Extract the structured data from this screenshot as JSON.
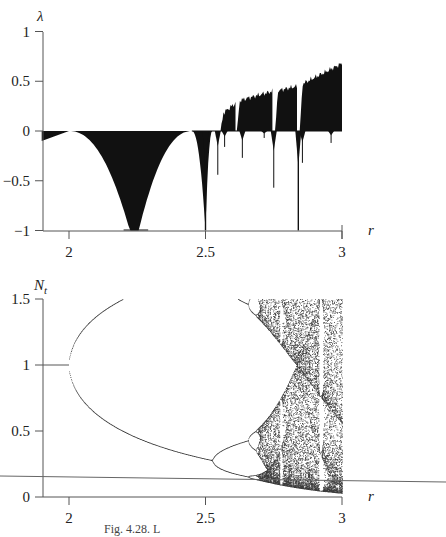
{
  "figure": {
    "caption": "Fig. 4.28. L",
    "colors": {
      "ink": "#111111",
      "axis": "#555555",
      "background": "#ffffff",
      "stray_line": "#666666"
    }
  },
  "chart_data": [
    {
      "type": "area",
      "title": "",
      "xlabel": "r",
      "ylabel": "λ",
      "xlim": [
        1.9,
        3.0
      ],
      "ylim": [
        -1,
        1
      ],
      "xticks": [
        2,
        2.5,
        3
      ],
      "xtick_labels": [
        "2",
        "2.5",
        "3"
      ],
      "yticks": [
        1,
        0.5,
        0,
        -0.5,
        -1
      ],
      "ytick_labels": [
        "1",
        "0.5",
        "0",
        "−0.5",
        "−1"
      ],
      "grid": false,
      "legend": null,
      "description": "Lyapunov exponent λ vs r, filled black between curve and λ=0",
      "series": [
        {
          "name": "Lyapunov exponent",
          "x": [
            1.9,
            2.0,
            2.05,
            2.1,
            2.15,
            2.2,
            2.25,
            2.3,
            2.35,
            2.4,
            2.45,
            2.47,
            2.49,
            2.5,
            2.51,
            2.53,
            2.55,
            2.56,
            2.57,
            2.6,
            2.63,
            2.65,
            2.7,
            2.74,
            2.75,
            2.76,
            2.8,
            2.83,
            2.84,
            2.85,
            2.9,
            2.95,
            3.0
          ],
          "y": [
            -0.1,
            0.0,
            -0.12,
            -0.28,
            -0.5,
            -0.8,
            -1.0,
            -0.8,
            -0.5,
            -0.25,
            -0.05,
            -0.3,
            -0.55,
            -1.0,
            -0.3,
            -0.1,
            -0.05,
            0.1,
            0.2,
            0.27,
            0.3,
            -0.25,
            0.34,
            0.38,
            -0.58,
            0.42,
            0.43,
            0.4,
            -1.0,
            0.45,
            0.55,
            0.62,
            0.68
          ]
        }
      ],
      "spikes_negative": [
        {
          "r": 2.5,
          "depth": -1.0
        },
        {
          "r": 2.545,
          "depth": -0.44
        },
        {
          "r": 2.57,
          "depth": -0.16
        },
        {
          "r": 2.635,
          "depth": -0.27
        },
        {
          "r": 2.715,
          "depth": -0.07
        },
        {
          "r": 2.75,
          "depth": -0.57
        },
        {
          "r": 2.84,
          "depth": -1.0
        },
        {
          "r": 2.855,
          "depth": -0.32
        },
        {
          "r": 2.96,
          "depth": -0.12
        }
      ]
    },
    {
      "type": "scatter",
      "title": "",
      "xlabel": "r",
      "ylabel": "N_t",
      "xlim": [
        1.9,
        3.0
      ],
      "ylim": [
        0,
        1.5
      ],
      "xticks": [
        2,
        2.5,
        3
      ],
      "xtick_labels": [
        "2",
        "2.5",
        "3"
      ],
      "yticks": [
        1.5,
        1,
        0.5,
        0
      ],
      "ytick_labels": [
        "1.5",
        "1",
        "0.5",
        "0"
      ],
      "grid": false,
      "legend": null,
      "description": "Bifurcation diagram of N_t vs r: fixed point 1 until r=2, period-doubling cascade near 2.45–2.57, chaos up to r=3 with periodic windows",
      "fixed_point": {
        "r_range": [
          1.9,
          2.0
        ],
        "N": 1.0
      },
      "period2_branches": {
        "r": [
          2.0,
          2.1,
          2.2,
          2.3,
          2.4,
          2.45
        ],
        "upper": [
          1.0,
          1.12,
          1.16,
          1.18,
          1.19,
          1.2
        ],
        "lower": [
          1.0,
          0.84,
          0.76,
          0.7,
          0.66,
          0.64
        ]
      },
      "period4_onset_r": 2.45,
      "chaos_onset_r": 2.57,
      "chaos_envelope": {
        "r": [
          2.57,
          2.7,
          2.8,
          2.9,
          3.0
        ],
        "max": [
          1.22,
          1.25,
          1.28,
          1.3,
          1.32
        ],
        "min": [
          0.5,
          0.38,
          0.25,
          0.12,
          0.0
        ]
      },
      "periodic_windows_r": [
        2.63,
        2.74,
        2.83
      ]
    }
  ]
}
